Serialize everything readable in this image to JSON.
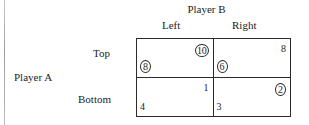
{
  "figure": {
    "column_player": "Player B",
    "row_player": "Player A",
    "columns": [
      "Left",
      "Right"
    ],
    "rows": [
      "Top",
      "Bottom"
    ]
  },
  "chart_data": {
    "type": "table",
    "title": "",
    "xlabel": "Player B",
    "ylabel": "Player A",
    "categories": [
      "Left",
      "Right"
    ],
    "rows": [
      "Top",
      "Bottom"
    ],
    "cells": [
      {
        "row": "Top",
        "column": "Left",
        "column_player_payoff": "10",
        "column_player_circled": true,
        "row_player_payoff": "8",
        "row_player_circled": true
      },
      {
        "row": "Top",
        "column": "Right",
        "column_player_payoff": "8",
        "column_player_circled": false,
        "row_player_payoff": "6",
        "row_player_circled": true
      },
      {
        "row": "Bottom",
        "column": "Left",
        "column_player_payoff": "1",
        "column_player_circled": false,
        "row_player_payoff": "4",
        "row_player_circled": false
      },
      {
        "row": "Bottom",
        "column": "Right",
        "column_player_payoff": "2",
        "column_player_circled": true,
        "row_player_payoff": "3",
        "row_player_circled": false
      }
    ]
  },
  "colors": {
    "ink": "#1c1c1c",
    "rule": "#2b2b2b",
    "background": "#ffffff",
    "page_edge": "#9d9d9d"
  }
}
